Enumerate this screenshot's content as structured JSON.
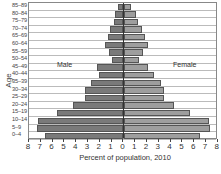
{
  "chart_data": {
    "type": "bar",
    "subtype": "population-pyramid",
    "title": "",
    "xlabel": "Percent of population, 2010",
    "ylabel": "Age",
    "xlim": [
      -8,
      8
    ],
    "x_ticks": [
      "8",
      "7",
      "6",
      "5",
      "4",
      "3",
      "2",
      "1",
      "0",
      "1",
      "2",
      "3",
      "4",
      "5",
      "6",
      "7",
      "8"
    ],
    "grid": true,
    "legend": {
      "type": "inline-labels",
      "entries": [
        "Male",
        "Female"
      ]
    },
    "categories": [
      "85–89",
      "80–84",
      "75–79",
      "70–74",
      "65–69",
      "60–64",
      "55–59",
      "50–54",
      "45–49",
      "40–44",
      "35–39",
      "30–34",
      "25–29",
      "20–24",
      "15–19",
      "10–14",
      "5–9",
      "0–4"
    ],
    "series": [
      {
        "name": "Male",
        "color": "#7a7a7a",
        "values": [
          0.4,
          0.7,
          0.8,
          1.1,
          1.3,
          1.5,
          1.2,
          0.9,
          2.2,
          2.0,
          2.7,
          3.2,
          3.2,
          4.2,
          5.6,
          7.2,
          7.3,
          6.6
        ]
      },
      {
        "name": "Female",
        "color": "#9e9e9e",
        "values": [
          0.6,
          1.0,
          1.2,
          1.5,
          1.8,
          2.0,
          1.6,
          1.3,
          2.0,
          2.5,
          3.1,
          3.4,
          3.4,
          4.2,
          5.6,
          7.2,
          7.3,
          6.4
        ]
      }
    ]
  },
  "labels": {
    "male": "Male",
    "female": "Female",
    "ylabel": "Age",
    "xlabel": "Percent of population, 2010"
  }
}
